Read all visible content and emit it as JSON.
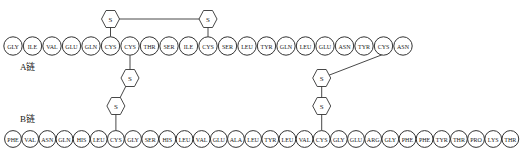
{
  "diagram": {
    "sulfur_label": "S",
    "chain_a": {
      "label": "A链",
      "residues": [
        "GLY",
        "ILE",
        "VAL",
        "GLU",
        "GLN",
        "CYS",
        "CYS",
        "THR",
        "SER",
        "ILE",
        "CYS",
        "SER",
        "LEU",
        "TYR",
        "GLN",
        "LEU",
        "GLU",
        "ASN",
        "TYR",
        "CYS",
        "ASN"
      ]
    },
    "chain_b": {
      "label": "B链",
      "residues": [
        "PHE",
        "VAL",
        "ASN",
        "GLN",
        "HIS",
        "LEU",
        "CYS",
        "GLY",
        "SER",
        "HIS",
        "LEU",
        "VAL",
        "GLU",
        "ALA",
        "LEU",
        "TYR",
        "LEU",
        "VAL",
        "CYS",
        "GLY",
        "GLU",
        "ARG",
        "GLY",
        "PHE",
        "PHE",
        "TYR",
        "THR",
        "PRO",
        "LYS",
        "THR"
      ]
    },
    "disulfide_bonds": [
      {
        "type": "intrachain",
        "from": "A6",
        "to": "A11"
      },
      {
        "type": "interchain",
        "from": "A7",
        "to": "B7"
      },
      {
        "type": "interchain",
        "from": "A20",
        "to": "B19"
      }
    ]
  }
}
